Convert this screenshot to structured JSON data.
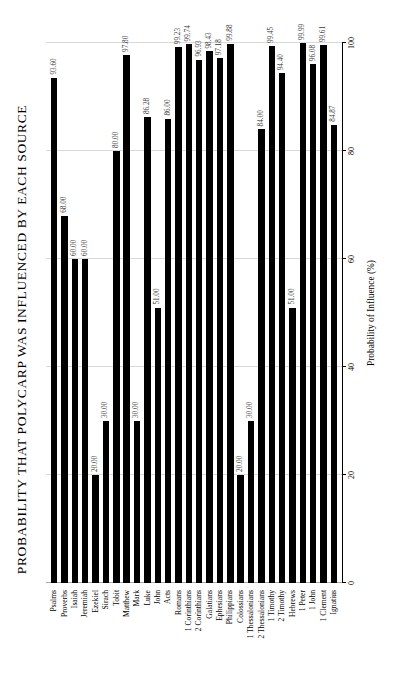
{
  "chart_data": {
    "type": "bar",
    "orientation": "horizontal",
    "title": "PROBABILITY THAT POLYCARP WAS INFLUENCED BY EACH SOURCE",
    "xlabel": "Probability of Influence (%)",
    "ylabel": "",
    "xlim": [
      0,
      100
    ],
    "xticks": [
      0,
      20,
      40,
      60,
      80,
      100
    ],
    "grid": true,
    "legend": null,
    "bar_color": "#000000",
    "categories": [
      "Psalms",
      "Proverbs",
      "Isaiah",
      "Jeremiah",
      "Ezekiel",
      "Sirach",
      "Tobit",
      "Matthew",
      "Mark",
      "Luke",
      "John",
      "Acts",
      "Romans",
      "1 Corinthians",
      "2 Corinthians",
      "Galatians",
      "Ephesians",
      "Philippians",
      "Colossians",
      "1 Thessalonians",
      "2 Thessalonians",
      "1 Timothy",
      "2 Timothy",
      "Hebrews",
      "1 Peter",
      "1 John",
      "1 Clement",
      "Ignatius"
    ],
    "values": [
      93.6,
      68.0,
      60.0,
      60.0,
      20.0,
      30.0,
      80.0,
      97.8,
      30.0,
      86.28,
      51.0,
      86.0,
      99.23,
      99.74,
      96.93,
      98.43,
      97.18,
      99.88,
      20.0,
      30.0,
      84.0,
      99.45,
      94.4,
      51.0,
      99.99,
      96.08,
      99.61,
      84.87
    ],
    "value_labels": [
      "93.60",
      "68.00",
      "60.00",
      "60.00",
      "20.00",
      "30.00",
      "80.00",
      "97.80",
      "30.00",
      "86.28",
      "51.00",
      "86.00",
      "99.23",
      "99.74",
      "96.93",
      "98.43",
      "97.18",
      "99.88",
      "20.00",
      "30.00",
      "84.00",
      "99.45",
      "94.40",
      "51.00",
      "99.99",
      "96.08",
      "99.61",
      "84.87"
    ],
    "xtick_labels": [
      "0",
      "20",
      "40",
      "60",
      "80",
      "100"
    ]
  }
}
